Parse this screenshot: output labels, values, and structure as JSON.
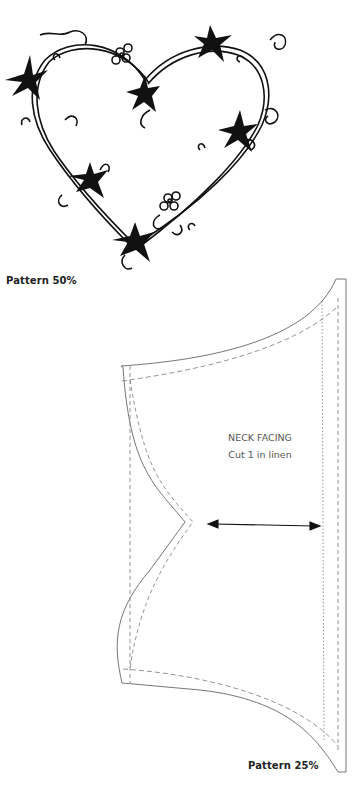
{
  "figure_top": {
    "caption": "Pattern 50%",
    "subject": "heart-shaped vine wreath with star leaves and flowers"
  },
  "figure_bottom": {
    "caption": "Pattern 25%",
    "piece_title": "NECK FACING",
    "piece_instruction": "Cut 1 in linen",
    "grainline": "double-headed-arrow"
  }
}
